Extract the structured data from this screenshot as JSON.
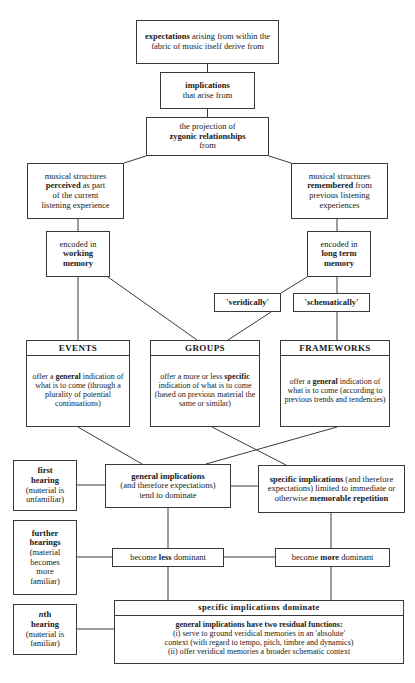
{
  "diagram": {
    "background_color": "#ffffff",
    "line_color": "#3a3a3a",
    "text_color": "#1a1a1a",
    "nodes": {
      "expectations": {
        "text": "expectations arising from within the fabric of music itself derive from",
        "bold_terms": [
          "expectations"
        ]
      },
      "implications": {
        "text": "implications that arise from",
        "bold_terms": [
          "implications"
        ]
      },
      "zygonic": {
        "text": "the projection of zygonic relationships from",
        "bold_terms": [
          "zygonic relationships"
        ]
      },
      "perceived": {
        "text": "musical structures perceived as part of the current listening experience",
        "bold_terms": [
          "perceived"
        ]
      },
      "remembered": {
        "text": "musical structures remembered from previous listening experiences",
        "bold_terms": [
          "remembered"
        ]
      },
      "working_memory": {
        "text": "encoded in working memory",
        "bold_terms": [
          "working memory"
        ]
      },
      "long_term_memory": {
        "text": "encoded in long term memory",
        "bold_terms": [
          "long term memory"
        ]
      },
      "veridically": {
        "text": "'veridically'"
      },
      "schematically": {
        "text": "'schematically'"
      },
      "events": {
        "header": "EVENTS",
        "body": "offer a general indication of what is to come (through a plurality of potential continuations)",
        "bold_terms": [
          "general"
        ]
      },
      "groups": {
        "header": "GROUPS",
        "body": "offer a more or less specific indication of what is to come (based on previous material the same or similar)",
        "bold_terms": [
          "specific"
        ]
      },
      "frameworks": {
        "header": "FRAMEWORKS",
        "body": "offer a general indication of what is to come (according to previous trends and tendencies)",
        "bold_terms": [
          "general"
        ]
      },
      "first_hearing": {
        "text": "first hearing (material is unfamiliar)",
        "bold_terms": [
          "first hearing"
        ]
      },
      "further_hearings": {
        "text": "further hearings (material becomes more familiar)",
        "bold_terms": [
          "further hearings"
        ]
      },
      "nth_hearing": {
        "text": "nth hearing (material is familiar)",
        "bold_terms": [
          "nth hearing"
        ],
        "italic_terms": [
          "n"
        ]
      },
      "general_implications": {
        "text": "general implications (and therefore expectations) tend to dominate",
        "bold_terms": [
          "general implications"
        ]
      },
      "specific_implications": {
        "text": "specific implications (and therefore expectations) limited to immediate or otherwise memorable repetition",
        "bold_terms": [
          "specific implications",
          "memorable repetition"
        ]
      },
      "become_less_dominant": {
        "text": "become less dominant",
        "bold_terms": [
          "less"
        ]
      },
      "become_more_dominant": {
        "text": "become more dominant",
        "bold_terms": [
          "more"
        ]
      },
      "final": {
        "header": "specific implications dominate",
        "line1": "general implications have two residual functions:",
        "line2": "(i) serve to ground veridical memories in an 'absolute'",
        "line3": "context (with regard to tempo, pitch, timbre and dynamics)",
        "line4": "(ii) offer veridical memories a broader schematic context"
      }
    }
  }
}
